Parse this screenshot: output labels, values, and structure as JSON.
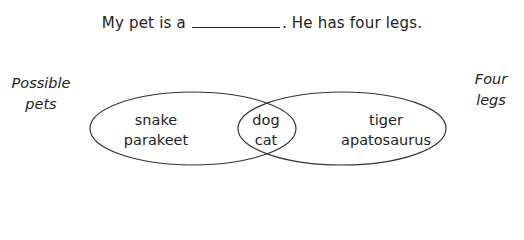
{
  "sentence": {
    "before_blank": "My pet is a",
    "after_blank": ". He has four legs."
  },
  "labels": {
    "left_set": [
      "Possible",
      "pets"
    ],
    "right_set": [
      "Four",
      "legs"
    ]
  },
  "venn": {
    "left_only": [
      "snake",
      "parakeet"
    ],
    "intersection": [
      "dog",
      "cat"
    ],
    "right_only": [
      "tiger",
      "apatosaurus"
    ],
    "stroke_color": "#333333"
  }
}
